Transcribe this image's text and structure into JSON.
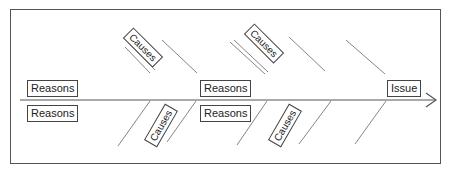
{
  "diagram": {
    "type": "fishbone",
    "issue_label": "Issue",
    "top_reasons": [
      {
        "label": "Reasons"
      },
      {
        "label": "Reasons"
      }
    ],
    "bottom_reasons": [
      {
        "label": "Reasons"
      },
      {
        "label": "Reasons"
      }
    ],
    "top_causes": [
      {
        "label": "Causes"
      },
      {
        "label": "Causes"
      }
    ],
    "bottom_causes": [
      {
        "label": "Causes"
      },
      {
        "label": "Causes"
      }
    ],
    "colors": {
      "line": "#666666",
      "border": "#444444",
      "text": "#222222",
      "background": "#ffffff"
    }
  }
}
